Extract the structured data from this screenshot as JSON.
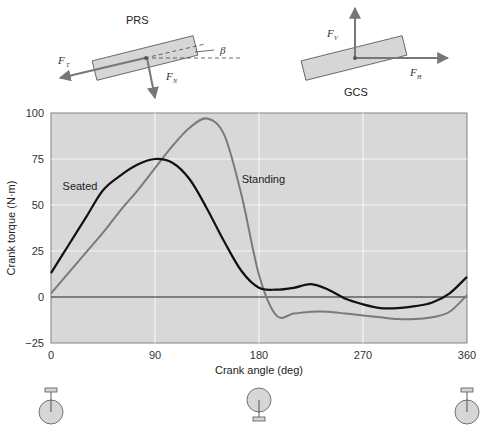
{
  "diagrams": {
    "prs": {
      "title": "PRS",
      "force_tangential": {
        "symbol": "F",
        "subscript": "T"
      },
      "force_normal": {
        "symbol": "F",
        "subscript": "N"
      },
      "angle_symbol": "β"
    },
    "gcs": {
      "title": "GCS",
      "force_vertical": {
        "symbol": "F",
        "subscript": "V"
      },
      "force_horizontal": {
        "symbol": "F",
        "subscript": "H"
      }
    }
  },
  "chart_data": {
    "type": "line",
    "title": "",
    "xlabel": "Crank angle (deg)",
    "ylabel": "Crank torque (N·m)",
    "xlim": [
      0,
      360
    ],
    "ylim": [
      -25,
      100
    ],
    "x_ticks": [
      "0",
      "90",
      "180",
      "270",
      "360"
    ],
    "y_ticks": [
      "100",
      "75",
      "50",
      "25",
      "0",
      "−25"
    ],
    "grid": true,
    "legend": "inline labels",
    "x": [
      0,
      15,
      30,
      45,
      60,
      75,
      90,
      105,
      120,
      135,
      150,
      165,
      180,
      195,
      210,
      225,
      240,
      255,
      270,
      285,
      300,
      315,
      330,
      345,
      360
    ],
    "series": [
      {
        "name": "Seated",
        "color": "#111111",
        "values": [
          13,
          28,
          43,
          58,
          66,
          72,
          75,
          73,
          64,
          48,
          30,
          14,
          5,
          4,
          5,
          7,
          4,
          -1,
          -4,
          -6,
          -6,
          -5,
          -3,
          2,
          11
        ]
      },
      {
        "name": "Standing",
        "color": "#7a7a7a",
        "values": [
          2,
          13,
          24,
          35,
          47,
          58,
          70,
          82,
          92,
          97,
          88,
          55,
          12,
          -10,
          -9,
          -8,
          -8,
          -9,
          -10,
          -11,
          -12,
          -12,
          -11,
          -8,
          1
        ]
      }
    ],
    "annotations": [
      {
        "text": "Seated",
        "x": 10,
        "y": 58
      },
      {
        "text": "Standing",
        "x": 165,
        "y": 62
      }
    ]
  },
  "crank_positions": [
    {
      "angle_label": "0",
      "pedal": "top"
    },
    {
      "angle_label": "180",
      "pedal": "bottom"
    },
    {
      "angle_label": "360",
      "pedal": "top"
    }
  ]
}
